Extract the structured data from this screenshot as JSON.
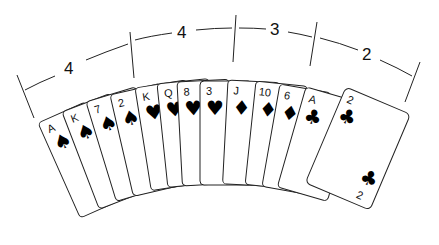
{
  "figure": {
    "distribution": [
      {
        "suit": "spades",
        "count": "4"
      },
      {
        "suit": "hearts",
        "count": "4"
      },
      {
        "suit": "diamonds",
        "count": "3"
      },
      {
        "suit": "clubs",
        "count": "2"
      }
    ],
    "cards": [
      {
        "rank": "A",
        "suit": "spades",
        "glyph": "♠"
      },
      {
        "rank": "K",
        "suit": "spades",
        "glyph": "♠"
      },
      {
        "rank": "7",
        "suit": "spades",
        "glyph": "♠"
      },
      {
        "rank": "2",
        "suit": "spades",
        "glyph": "♠"
      },
      {
        "rank": "K",
        "suit": "hearts",
        "glyph": "♥"
      },
      {
        "rank": "Q",
        "suit": "hearts",
        "glyph": "♥"
      },
      {
        "rank": "8",
        "suit": "hearts",
        "glyph": "♥"
      },
      {
        "rank": "3",
        "suit": "hearts",
        "glyph": "♥"
      },
      {
        "rank": "J",
        "suit": "diamonds",
        "glyph": "♦"
      },
      {
        "rank": "10",
        "suit": "diamonds",
        "glyph": "♦"
      },
      {
        "rank": "6",
        "suit": "diamonds",
        "glyph": "♦"
      },
      {
        "rank": "A",
        "suit": "clubs",
        "glyph": "♣"
      },
      {
        "rank": "2",
        "suit": "clubs",
        "glyph": "♣"
      }
    ]
  }
}
